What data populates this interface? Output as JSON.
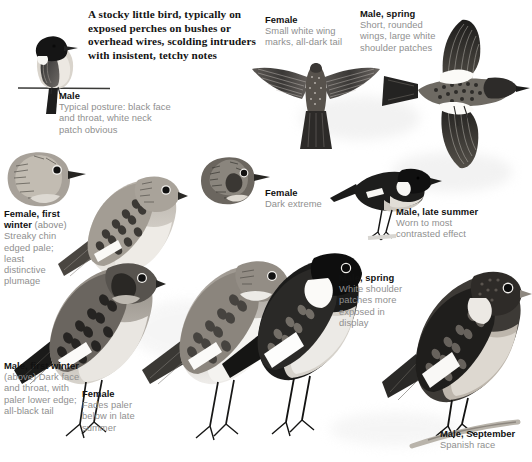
{
  "plate": {
    "title_text": "A stocky little bird, typically on\nexposed perches on bushes or\noverhead wires, scolding intruders\nwith insistent, tetchy notes",
    "page_kind": "field-guide-plate",
    "background_color": "#ffffff",
    "heading_color": "#111111",
    "caption_color": "#8a8a8a"
  },
  "captions": [
    {
      "id": "male-perched",
      "heading": "Male",
      "sub": "",
      "body": "Typical posture: black face\nand throat, white neck\npatch obvious"
    },
    {
      "id": "female-flight",
      "heading": "Female",
      "sub": "",
      "body": "Small white wing\nmarks, all-dark tail"
    },
    {
      "id": "male-spring-flight",
      "heading": "Male, spring",
      "sub": "",
      "body": "Short, rounded\nwings, large white\nshoulder patches"
    },
    {
      "id": "female-dark-head",
      "heading": "Female",
      "sub": "",
      "body": "Dark extreme"
    },
    {
      "id": "male-late-summer",
      "heading": "Male, late summer",
      "sub": "",
      "body": "Worn to most\ncontrasted effect"
    },
    {
      "id": "female-first-winter",
      "heading": "Female, first",
      "heading2": "winter",
      "sub": " (above)",
      "body": "Streaky chin\nedged pale;\nleast\ndistinctive\nplumage"
    },
    {
      "id": "male-first-winter",
      "heading": "Male, first winter",
      "sub": "",
      "body": "(above) Dark face\nand throat, with\npaler lower edge;\nall-black tail"
    },
    {
      "id": "female-fading",
      "heading": "Female",
      "sub": "",
      "body": "Fades paler\nbelow in late\nsummer"
    },
    {
      "id": "male-spring-perched",
      "heading": "Male, spring",
      "sub": "",
      "body": "White shoulder\npatches more\nexposed in\ndisplay"
    },
    {
      "id": "male-september",
      "heading": "Male, September",
      "sub": "",
      "body": "Spanish race"
    }
  ],
  "figures": [
    {
      "id": "male-on-wire",
      "name": "male-perched-on-wire-illustration"
    },
    {
      "id": "female-spread-flight",
      "name": "female-spread-wings-flight-illustration"
    },
    {
      "id": "male-spring-flight",
      "name": "male-spring-flight-illustration"
    },
    {
      "id": "female-dark-head",
      "name": "female-dark-extreme-head-illustration"
    },
    {
      "id": "male-late-summer",
      "name": "male-late-summer-perched-illustration"
    },
    {
      "id": "female-fw-head",
      "name": "female-first-winter-head-illustration"
    },
    {
      "id": "female-fw-body",
      "name": "female-first-winter-perched-illustration"
    },
    {
      "id": "male-fw-body",
      "name": "male-first-winter-perched-illustration"
    },
    {
      "id": "female-fading-body",
      "name": "female-fading-perched-illustration"
    },
    {
      "id": "male-spring-perched",
      "name": "male-spring-perched-illustration"
    },
    {
      "id": "male-september",
      "name": "male-september-spanish-race-illustration"
    }
  ]
}
